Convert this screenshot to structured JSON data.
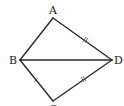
{
  "diagram": {
    "type": "geometry",
    "stroke_color": "#2a2a2a",
    "vertices": {
      "A": {
        "label": "A",
        "x": 53,
        "y": 18
      },
      "B": {
        "label": "B",
        "x": 20,
        "y": 60
      },
      "C": {
        "label": "C",
        "x": 53,
        "y": 101
      },
      "D": {
        "label": "D",
        "x": 112,
        "y": 60
      }
    },
    "segments": [
      {
        "from": "A",
        "to": "B",
        "ticks": 1
      },
      {
        "from": "A",
        "to": "D",
        "ticks": 2
      },
      {
        "from": "B",
        "to": "C",
        "ticks": 1
      },
      {
        "from": "C",
        "to": "D",
        "ticks": 2
      },
      {
        "from": "B",
        "to": "D",
        "ticks": 0
      }
    ],
    "relations": [
      "AB = BC",
      "AD = DC"
    ]
  }
}
